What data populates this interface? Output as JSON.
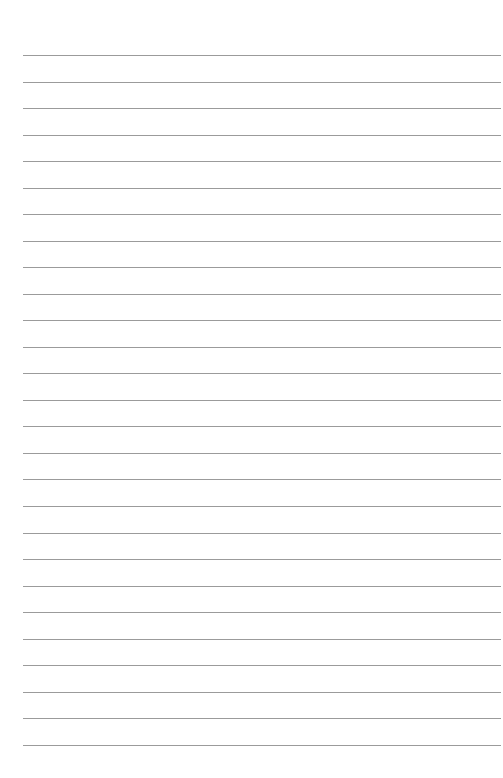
{
  "page": {
    "type": "lined-paper",
    "background": "#ffffff",
    "line_color": "#8a8a8a",
    "line_count": 27,
    "first_line_y": 55,
    "line_spacing": 26.53,
    "line_left": 23,
    "line_right": 501
  }
}
